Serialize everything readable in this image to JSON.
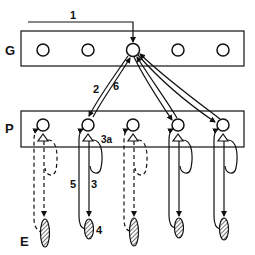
{
  "labels": {
    "row_g": "G",
    "row_p": "P",
    "row_e": "E"
  },
  "edges": {
    "e1": "1",
    "e2": "2",
    "e6": "6",
    "e3a": "3a",
    "e5": "5",
    "e3": "3",
    "e4": "4"
  },
  "colors": {
    "stroke": "#111111",
    "background": "#ffffff",
    "hatch": "#444444"
  }
}
